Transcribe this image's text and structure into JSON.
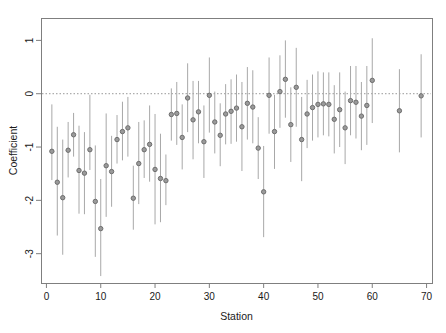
{
  "chart_data": {
    "type": "scatter",
    "title": "",
    "subtitle": "",
    "xlabel": "Station",
    "ylabel": "Coefficient",
    "xlim": [
      -1,
      71
    ],
    "ylim": [
      -3.55,
      1.42
    ],
    "xticks": [
      0,
      10,
      20,
      30,
      40,
      50,
      60,
      70
    ],
    "xticklabels": [
      "0",
      "10",
      "20",
      "30",
      "40",
      "50",
      "60",
      "70"
    ],
    "yticks": [
      1,
      0,
      -1,
      -2,
      -3
    ],
    "yticklabels": [
      "1",
      "0",
      "-1",
      "-2",
      "-3"
    ],
    "grid": false,
    "legend": null,
    "reference_line": {
      "orientation": "horizontal",
      "value": 0,
      "style": "dotted",
      "color": "#999999"
    },
    "marker": {
      "shape": "circle",
      "facecolor": "#9a9a9a",
      "edgecolor": "#6e6e6e",
      "size": 4.4
    },
    "errorbar": {
      "color": "#a8a8a8",
      "linewidth": 1.0,
      "caps": false,
      "description": "vertical 95% confidence interval whiskers"
    },
    "series": [
      {
        "name": "Station coefficient estimates with 95% CI",
        "x": [
          1,
          2,
          3,
          4,
          5,
          6,
          7,
          8,
          9,
          10,
          11,
          12,
          13,
          14,
          15,
          16,
          17,
          18,
          19,
          20,
          21,
          22,
          23,
          24,
          25,
          26,
          27,
          28,
          29,
          30,
          31,
          32,
          33,
          34,
          35,
          36,
          37,
          38,
          39,
          40,
          41,
          42,
          43,
          44,
          45,
          46,
          47,
          48,
          49,
          50,
          51,
          52,
          53,
          54,
          55,
          56,
          57,
          58,
          59,
          60,
          65,
          69
        ],
        "y": [
          -1.08,
          -1.66,
          -1.95,
          -1.06,
          -0.77,
          -1.44,
          -1.49,
          -1.05,
          -2.02,
          -2.53,
          -1.35,
          -1.46,
          -0.86,
          -0.71,
          -0.64,
          -1.96,
          -1.31,
          -1.05,
          -0.95,
          -1.42,
          -1.59,
          -1.63,
          -0.39,
          -0.37,
          -0.82,
          -0.08,
          -0.49,
          -0.34,
          -0.9,
          -0.03,
          -0.53,
          -0.78,
          -0.38,
          -0.33,
          -0.27,
          -0.62,
          -0.18,
          -0.25,
          -1.02,
          -1.84,
          -0.03,
          -0.71,
          0.04,
          0.27,
          -0.58,
          0.12,
          -0.86,
          -0.38,
          -0.26,
          -0.2,
          -0.19,
          -0.2,
          -0.48,
          -0.3,
          -0.64,
          -0.13,
          -0.16,
          -0.42,
          -0.22,
          0.25,
          -0.32,
          -0.04
        ],
        "ylo": [
          -1.62,
          -2.66,
          -3.02,
          -1.57,
          -1.18,
          -2.25,
          -2.26,
          -1.43,
          -3.06,
          -3.42,
          -2.31,
          -2.12,
          -1.31,
          -1.25,
          -1.18,
          -2.55,
          -2.07,
          -1.58,
          -1.65,
          -2.45,
          -2.41,
          -2.09,
          -0.88,
          -0.96,
          -1.42,
          -0.72,
          -1.23,
          -0.93,
          -1.58,
          -0.73,
          -1.12,
          -1.36,
          -0.95,
          -0.94,
          -0.9,
          -1.45,
          -0.86,
          -0.93,
          -1.6,
          -2.69,
          -0.75,
          -1.41,
          -0.64,
          -0.45,
          -1.28,
          -0.62,
          -1.64,
          -1.02,
          -0.88,
          -0.82,
          -0.78,
          -0.8,
          -1.12,
          -1.0,
          -1.32,
          -0.78,
          -0.84,
          -1.06,
          -0.96,
          -0.55,
          -1.1,
          -0.82
        ],
        "yhi": [
          -0.2,
          -0.62,
          -0.86,
          -0.53,
          -0.36,
          -0.6,
          -0.72,
          -0.02,
          -0.97,
          -1.6,
          -0.37,
          -0.79,
          -0.4,
          -0.15,
          -0.06,
          -1.35,
          -0.53,
          -0.5,
          -0.22,
          -0.38,
          -0.75,
          -1.14,
          0.1,
          0.22,
          -0.2,
          0.57,
          0.24,
          0.24,
          -0.22,
          0.68,
          0.04,
          -0.18,
          0.18,
          0.27,
          0.36,
          0.22,
          0.5,
          0.44,
          -0.44,
          -0.98,
          0.68,
          -0.02,
          0.72,
          1.0,
          0.12,
          0.86,
          -0.06,
          0.26,
          0.36,
          0.42,
          0.4,
          0.4,
          0.16,
          0.4,
          0.04,
          0.52,
          0.52,
          0.22,
          0.52,
          1.04,
          0.46,
          0.74
        ]
      }
    ]
  },
  "figure": {
    "plot_area": {
      "left": 41,
      "top": 18,
      "right": 432,
      "bottom": 283
    },
    "background_color": "#ffffff",
    "frame_color": "#7f7f7f",
    "text_color": "#1a1a1a"
  }
}
